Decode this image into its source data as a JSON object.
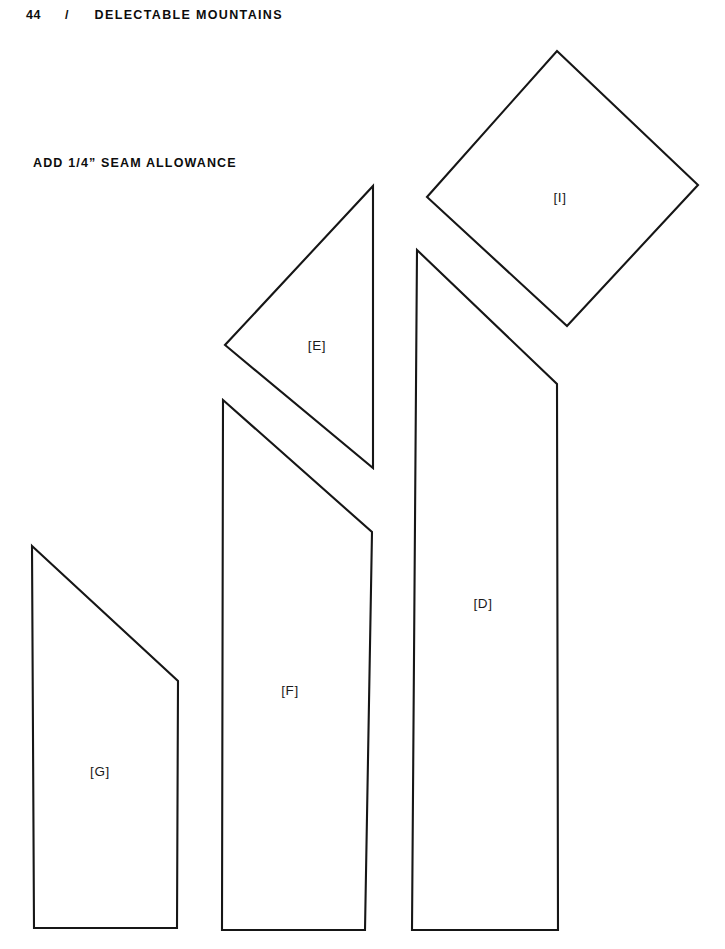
{
  "page": {
    "width": 725,
    "height": 949,
    "background_color": "#ffffff",
    "ink_color": "#161616"
  },
  "running_head": {
    "folio": "44",
    "separator": "/",
    "title": "DELECTABLE MOUNTAINS"
  },
  "instruction": {
    "seam_allowance_note": "ADD 1/4” SEAM ALLOWANCE"
  },
  "diagram": {
    "type": "quilt-pattern-template-plate",
    "pieces": [
      {
        "id": "I",
        "label": "[I]",
        "shape": "diamond",
        "label_x": 560,
        "label_y": 197,
        "points": "557,51 698,185 567,326 427,197"
      },
      {
        "id": "E",
        "label": "[E]",
        "shape": "right-triangle",
        "label_x": 317,
        "label_y": 345,
        "points": "373,186 373,468 225,345"
      },
      {
        "id": "D",
        "label": "[D]",
        "shape": "quadrilateral",
        "label_x": 483,
        "label_y": 603,
        "points": "417,250 557,384 558,930 412,930"
      },
      {
        "id": "F",
        "label": "[F]",
        "shape": "quadrilateral",
        "label_x": 290,
        "label_y": 690,
        "points": "223,400 372,532 365,930 222,930"
      },
      {
        "id": "G",
        "label": "[G]",
        "shape": "quadrilateral",
        "label_x": 100,
        "label_y": 771,
        "points": "32,546 178,681 177,928 34,928"
      }
    ]
  }
}
